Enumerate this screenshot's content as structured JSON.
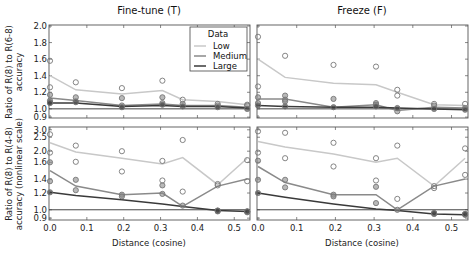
{
  "chart_data": [
    {
      "type": "line",
      "panel": "top-left",
      "title": "Fine-tune (T)",
      "xlabel": "",
      "ylabel": "Ratio of R(8) to R(6-8)\naccuracy",
      "xlim": [
        0.0,
        0.54
      ],
      "ylim": [
        0.9,
        2.0
      ],
      "yscale": "linear",
      "x_ticks": [
        "0.0",
        "0.1",
        "0.2",
        "0.3",
        "0.4",
        "0.5"
      ],
      "y_ticks": [
        2.0,
        1.8,
        1.6,
        1.4,
        1.2,
        1.0,
        0.9
      ],
      "y_tick_labels": [
        "2.0",
        "1.8",
        "1.6",
        "1.4",
        "1.2",
        "1.0",
        "0.9"
      ],
      "reference_line": 1.0,
      "x": [
        0.0,
        0.07,
        0.195,
        0.305,
        0.36,
        0.455,
        0.535
      ],
      "series": [
        {
          "name": "Low",
          "values": [
            1.4,
            1.23,
            1.18,
            1.22,
            1.11,
            1.09,
            1.05
          ],
          "points": [
            [
              0.0,
              1.58
            ],
            [
              0.0,
              1.26
            ],
            [
              0.07,
              1.32
            ],
            [
              0.195,
              1.25
            ],
            [
              0.305,
              1.34
            ],
            [
              0.36,
              1.11
            ],
            [
              0.455,
              1.06
            ],
            [
              0.535,
              1.05
            ]
          ]
        },
        {
          "name": "Medium",
          "values": [
            1.13,
            1.1,
            1.04,
            1.06,
            1.04,
            1.04,
            1.02
          ],
          "points": [
            [
              0.0,
              1.17
            ],
            [
              0.0,
              1.1
            ],
            [
              0.07,
              1.14
            ],
            [
              0.07,
              1.09
            ],
            [
              0.195,
              1.13
            ],
            [
              0.195,
              1.04
            ],
            [
              0.305,
              1.14
            ],
            [
              0.305,
              1.07
            ],
            [
              0.36,
              1.06
            ],
            [
              0.455,
              1.04
            ],
            [
              0.535,
              1.04
            ]
          ]
        },
        {
          "name": "Large",
          "values": [
            1.07,
            1.07,
            1.03,
            1.04,
            1.03,
            1.03,
            1.01
          ],
          "points": [
            [
              0.0,
              1.08
            ],
            [
              0.0,
              1.07
            ],
            [
              0.07,
              1.08
            ],
            [
              0.195,
              1.02
            ],
            [
              0.305,
              1.05
            ],
            [
              0.36,
              1.03
            ],
            [
              0.455,
              1.02
            ],
            [
              0.535,
              1.0
            ]
          ]
        }
      ]
    },
    {
      "type": "line",
      "panel": "top-right",
      "title": "Freeze (F)",
      "xlabel": "",
      "ylabel": "",
      "xlim": [
        0.0,
        0.54
      ],
      "ylim": [
        0.9,
        2.0
      ],
      "yscale": "linear",
      "x_ticks": [
        "0.0",
        "0.1",
        "0.2",
        "0.3",
        "0.4",
        "0.5"
      ],
      "reference_line": 1.0,
      "x": [
        0.0,
        0.07,
        0.195,
        0.305,
        0.36,
        0.455,
        0.535
      ],
      "series": [
        {
          "name": "Low",
          "values": [
            1.6,
            1.38,
            1.31,
            1.29,
            1.2,
            1.05,
            1.04
          ],
          "points": [
            [
              0.0,
              1.87
            ],
            [
              0.0,
              1.27
            ],
            [
              0.07,
              1.64
            ],
            [
              0.195,
              1.53
            ],
            [
              0.305,
              1.51
            ],
            [
              0.36,
              1.23
            ],
            [
              0.36,
              1.16
            ],
            [
              0.455,
              1.06
            ],
            [
              0.535,
              1.06
            ]
          ]
        },
        {
          "name": "Medium",
          "values": [
            1.12,
            1.12,
            1.02,
            1.05,
            0.98,
            1.02,
            1.01
          ],
          "points": [
            [
              0.0,
              1.14
            ],
            [
              0.0,
              1.07
            ],
            [
              0.07,
              1.16
            ],
            [
              0.07,
              1.11
            ],
            [
              0.07,
              1.09
            ],
            [
              0.195,
              1.12
            ],
            [
              0.305,
              1.07
            ],
            [
              0.305,
              1.05
            ],
            [
              0.36,
              0.97
            ],
            [
              0.455,
              1.04
            ],
            [
              0.535,
              1.01
            ]
          ]
        },
        {
          "name": "Large",
          "values": [
            1.04,
            1.03,
            1.02,
            1.02,
            1.01,
            1.0,
            0.99
          ],
          "points": [
            [
              0.0,
              1.04
            ],
            [
              0.07,
              1.03
            ],
            [
              0.195,
              1.02
            ],
            [
              0.305,
              1.03
            ],
            [
              0.36,
              1.01
            ],
            [
              0.455,
              1.0
            ],
            [
              0.535,
              0.99
            ]
          ]
        }
      ]
    },
    {
      "type": "line",
      "panel": "bottom-left",
      "title": "",
      "xlabel": "Distance (cosine)",
      "ylabel": "Ratio of R(8) to R(4-8)\naccuracy (nonlinear scale)",
      "xlim": [
        0.0,
        0.54
      ],
      "ylim": [
        0.9,
        3.0
      ],
      "yscale": "nonlinear",
      "x_ticks": [
        "0.0",
        "0.1",
        "0.2",
        "0.3",
        "0.4",
        "0.5"
      ],
      "y_ticks": [
        3.0,
        2.5,
        2.0,
        1.6,
        1.4,
        1.2,
        1.0,
        0.9
      ],
      "y_tick_labels": [
        "3.0",
        "2.5",
        "2.0",
        "1.6",
        "1.4",
        "1.2",
        "1.0",
        "0.9"
      ],
      "reference_line": 1.0,
      "x": [
        0.0,
        0.07,
        0.195,
        0.305,
        0.36,
        0.455,
        0.535
      ],
      "series": [
        {
          "name": "Low",
          "values": [
            2.3,
            1.97,
            1.75,
            1.58,
            1.77,
            1.32,
            1.75
          ],
          "points": [
            [
              0.0,
              2.7
            ],
            [
              0.0,
              1.95
            ],
            [
              0.07,
              2.2
            ],
            [
              0.07,
              1.62
            ],
            [
              0.195,
              2.0
            ],
            [
              0.195,
              1.49
            ],
            [
              0.305,
              1.65
            ],
            [
              0.305,
              1.38
            ],
            [
              0.36,
              2.4
            ],
            [
              0.36,
              1.22
            ],
            [
              0.455,
              1.33
            ],
            [
              0.455,
              1.31
            ],
            [
              0.535,
              1.68
            ],
            [
              0.535,
              1.37
            ]
          ]
        },
        {
          "name": "Medium",
          "values": [
            1.5,
            1.3,
            1.18,
            1.2,
            1.04,
            1.3,
            1.4
          ],
          "points": [
            [
              0.0,
              1.6
            ],
            [
              0.0,
              1.37
            ],
            [
              0.07,
              1.39
            ],
            [
              0.07,
              1.24
            ],
            [
              0.195,
              1.18
            ],
            [
              0.195,
              1.16
            ],
            [
              0.305,
              1.31
            ],
            [
              0.305,
              1.19
            ],
            [
              0.36,
              1.05
            ],
            [
              0.455,
              0.99
            ],
            [
              0.535,
              0.98
            ]
          ]
        },
        {
          "name": "Large",
          "values": [
            1.21,
            1.17,
            1.12,
            1.07,
            1.04,
            0.99,
            0.98
          ],
          "points": [
            [
              0.0,
              1.21
            ],
            [
              0.455,
              0.98
            ],
            [
              0.455,
              0.99
            ],
            [
              0.535,
              0.97
            ],
            [
              0.535,
              0.98
            ]
          ]
        }
      ]
    },
    {
      "type": "line",
      "panel": "bottom-right",
      "title": "",
      "xlabel": "Distance (cosine)",
      "ylabel": "",
      "xlim": [
        0.0,
        0.54
      ],
      "ylim": [
        0.9,
        3.0
      ],
      "yscale": "nonlinear",
      "x_ticks": [
        "0.0",
        "0.1",
        "0.2",
        "0.3",
        "0.4",
        "0.5"
      ],
      "reference_line": 1.0,
      "x": [
        0.0,
        0.07,
        0.195,
        0.305,
        0.36,
        0.455,
        0.535
      ],
      "series": [
        {
          "name": "Low",
          "values": [
            2.35,
            2.15,
            1.9,
            1.6,
            1.75,
            1.3,
            1.75
          ],
          "points": [
            [
              0.0,
              2.9
            ],
            [
              0.0,
              1.95
            ],
            [
              0.07,
              2.8
            ],
            [
              0.07,
              1.75
            ],
            [
              0.195,
              2.3
            ],
            [
              0.195,
              1.55
            ],
            [
              0.305,
              1.75
            ],
            [
              0.305,
              1.38
            ],
            [
              0.36,
              2.2
            ],
            [
              0.36,
              1.13
            ],
            [
              0.455,
              1.3
            ],
            [
              0.455,
              1.27
            ],
            [
              0.535,
              2.1
            ],
            [
              0.535,
              1.45
            ]
          ]
        },
        {
          "name": "Medium",
          "values": [
            1.55,
            1.35,
            1.18,
            1.18,
            1.0,
            1.3,
            1.4
          ],
          "points": [
            [
              0.0,
              1.66
            ],
            [
              0.0,
              1.39
            ],
            [
              0.07,
              1.39
            ],
            [
              0.07,
              1.28
            ],
            [
              0.195,
              1.18
            ],
            [
              0.195,
              1.16
            ],
            [
              0.305,
              1.29
            ],
            [
              0.305,
              1.08
            ],
            [
              0.36,
              1.0
            ],
            [
              0.455,
              0.96
            ],
            [
              0.535,
              0.95
            ]
          ]
        },
        {
          "name": "Large",
          "values": [
            1.2,
            1.15,
            1.07,
            1.01,
            0.99,
            0.95,
            0.94
          ],
          "points": [
            [
              0.0,
              1.2
            ],
            [
              0.455,
              0.95
            ],
            [
              0.455,
              0.96
            ],
            [
              0.535,
              0.94
            ],
            [
              0.535,
              0.95
            ]
          ]
        }
      ]
    }
  ],
  "legend": {
    "title": "Data",
    "placement": "top-right of top-left panel",
    "entries": [
      {
        "name": "Low",
        "color": "#c8c8c8"
      },
      {
        "name": "Medium",
        "color": "#8a8a8a"
      },
      {
        "name": "Large",
        "color": "#3a3a3a"
      }
    ]
  },
  "colors": {
    "Low": "#c8c8c8",
    "Medium": "#8a8a8a",
    "Large": "#3a3a3a",
    "reference": "#444444",
    "axis": "#555555"
  }
}
